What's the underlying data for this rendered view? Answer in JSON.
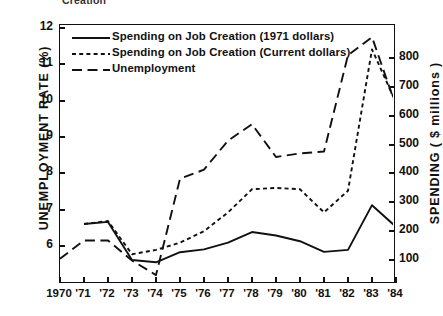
{
  "figure": {
    "clipped_caption": "Creation",
    "axis_left_title": "UNEMPLOYMENT RATE (%)",
    "axis_right_title": "SPENDING  ( $ millions )"
  },
  "legend": {
    "items": [
      {
        "label": "Spending on Job Creation (1971 dollars)",
        "style": "solid",
        "key": "spending_1971"
      },
      {
        "label": "Spending on Job Creation (Current dollars)",
        "style": "short-dash",
        "key": "spending_current"
      },
      {
        "label": "Unemployment",
        "style": "long-dash",
        "key": "unemployment"
      }
    ]
  },
  "chart_data": {
    "type": "line",
    "title": "",
    "xlabel": "",
    "ylabel": "UNEMPLOYMENT RATE (%)",
    "y2label": "SPENDING ( $ millions )",
    "grid": false,
    "legend_position": "top-left",
    "x": [
      1970,
      1971,
      1972,
      1973,
      1974,
      1975,
      1976,
      1977,
      1978,
      1979,
      1980,
      1981,
      1982,
      1983,
      1984
    ],
    "xtick_labels": [
      "1970",
      "'71",
      "'72",
      "'73",
      "'74",
      "'75",
      "'76",
      "'77",
      "'78",
      "'79",
      "'80",
      "'81",
      "'82",
      "'83",
      "'84"
    ],
    "ylim": [
      5.0,
      12.0
    ],
    "ytick_labels": [
      "6",
      "7",
      "8",
      "9",
      "10",
      "11",
      "12"
    ],
    "yticks": [
      6,
      7,
      8,
      9,
      10,
      11,
      12
    ],
    "y2lim": [
      0,
      900
    ],
    "y2tick_labels": [
      "100",
      "200",
      "300",
      "400",
      "500",
      "600",
      "700",
      "800"
    ],
    "y2ticks": [
      100,
      200,
      300,
      400,
      500,
      600,
      700,
      800
    ],
    "series": [
      {
        "name": "Unemployment",
        "axis": "left",
        "units": "percent",
        "style": "long-dash",
        "x": [
          1970,
          1971,
          1972,
          1973,
          1974,
          1975,
          1976,
          1977,
          1978,
          1979,
          1980,
          1981,
          1982,
          1983,
          1984
        ],
        "values": [
          5.65,
          6.15,
          6.15,
          5.6,
          5.2,
          7.85,
          8.1,
          8.9,
          9.35,
          8.45,
          8.55,
          8.6,
          11.25,
          11.75,
          9.85
        ]
      },
      {
        "name": "Spending on Job Creation (Current dollars)",
        "axis": "right",
        "units": "$ millions",
        "style": "short-dash",
        "x": [
          1971,
          1972,
          1973,
          1974,
          1975,
          1976,
          1977,
          1978,
          1979,
          1980,
          1981,
          1982,
          1983,
          1984
        ],
        "values": [
          225,
          235,
          120,
          135,
          160,
          200,
          265,
          345,
          350,
          345,
          265,
          340,
          830,
          645
        ]
      },
      {
        "name": "Spending on Job Creation (1971 dollars)",
        "axis": "right",
        "units": "$ millions (1971)",
        "style": "solid",
        "x": [
          1971,
          1972,
          1973,
          1974,
          1975,
          1976,
          1977,
          1978,
          1979,
          1980,
          1981,
          1982,
          1983,
          1984
        ],
        "values": [
          225,
          232,
          100,
          92,
          127,
          137,
          160,
          197,
          185,
          165,
          128,
          135,
          290,
          215
        ]
      }
    ]
  }
}
